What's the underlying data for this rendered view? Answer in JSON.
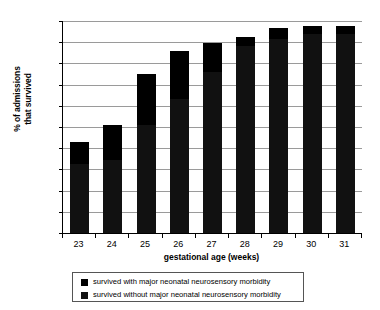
{
  "chart_data": {
    "type": "bar",
    "subtype": "stacked-bar",
    "title": "",
    "xlabel": "gestational age (weeks)",
    "ylabel": "% of admissions\nthat survived",
    "categories": [
      "23",
      "24",
      "25",
      "26",
      "27",
      "28",
      "29",
      "30",
      "31"
    ],
    "ylim": [
      0,
      100
    ],
    "yticks": [
      0,
      10,
      20,
      30,
      40,
      50,
      60,
      70,
      80,
      90,
      100
    ],
    "ytick_labels": [
      "0",
      "10",
      "20",
      "30",
      "40",
      "50",
      "60",
      "70",
      "80",
      "90",
      "100"
    ],
    "grid": true,
    "grid_axis": "y",
    "legend_position": "bottom",
    "series": [
      {
        "name": "survived without major neonatal neurosensory morbidity",
        "color": "#111111",
        "values": [
          32.5,
          34.5,
          51,
          63,
          76,
          88,
          91.5,
          94,
          94
        ]
      },
      {
        "name": "survived with major neonatal neurosensory morbidity",
        "color": "#000000",
        "values": [
          10.5,
          16.5,
          24,
          23,
          13.5,
          4.5,
          5,
          3.5,
          3.5
        ]
      }
    ],
    "totals": [
      43,
      51,
      75,
      86,
      89.5,
      92.5,
      96.5,
      97.5,
      97.5
    ]
  },
  "axes": {
    "y_title_line1": "% of admissions",
    "y_title_line2": "that survived",
    "x_title": "gestational age (weeks)"
  },
  "legend": {
    "entries": [
      {
        "label": "survived with major neonatal neurosensory morbidity",
        "color": "#000000"
      },
      {
        "label": "survived without major neonatal neurosensory morbidity",
        "color": "#111111"
      }
    ]
  }
}
